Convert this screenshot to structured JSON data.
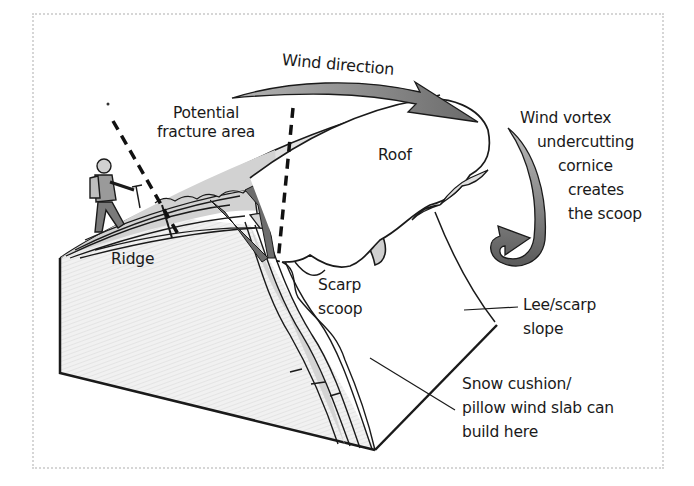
{
  "diagram": {
    "colors": {
      "outline": "#1a1a1a",
      "arrow_fill": "#8c8c8c",
      "arrow_dark": "#6a6a6a",
      "snow_layer": "#c9c9c9",
      "slope_shade": "#e8e8e8",
      "frame_dots": "#d6d6d6"
    },
    "labels": {
      "wind_direction": "Wind direction",
      "potential_fracture": [
        "Potential",
        "fracture area"
      ],
      "roof": "Roof",
      "wind_vortex": [
        "Wind vortex",
        "undercutting",
        "cornice",
        "creates",
        "the scoop"
      ],
      "ridge": "Ridge",
      "scarp_scoop": [
        "Scarp",
        "scoop"
      ],
      "lee_scarp_slope": [
        "Lee/scarp",
        "slope"
      ],
      "snow_cushion": [
        "Snow cushion/",
        "pillow wind slab can",
        "build here"
      ]
    },
    "icons": {
      "climber": "climber-figure",
      "wind_arrow": "curved-arrow",
      "vortex_arrow": "curled-arrow",
      "fracture_lines": "dashed-lines"
    }
  }
}
